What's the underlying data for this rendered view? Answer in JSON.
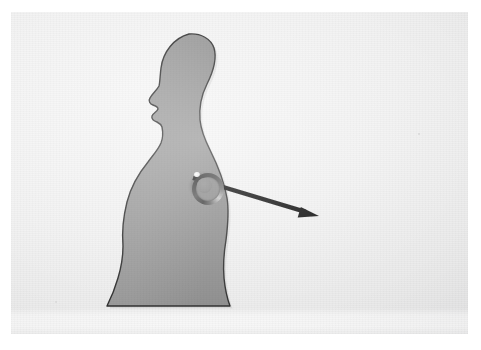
{
  "scene": {
    "kind": "photograph-of-printed-diagram",
    "description": "Photograph of a sheet of paper showing a gray human body silhouette in side profile facing left, with a small metal ring resting on the abdomen and a thick black arrow drawn from the ring toward the lower right.",
    "label": "body-silhouette-with-ring-and-arrow",
    "paper_color": "#f1f1f1",
    "page_margin_color": "#ffffff"
  },
  "silhouette": {
    "name": "human-body-profile",
    "orientation": "facing-left",
    "fill_color": "#979797",
    "outline_color": "#2e2e2e",
    "outline_width": 1.4,
    "parts": [
      "head",
      "nose",
      "lips",
      "chin",
      "neck",
      "chest",
      "abdomen",
      "hips",
      "legs"
    ],
    "path": "M 178 22 C 163 26 152 40 150 56 C 149 64 149 70 148 74 C 146 78 141 82 139 86 C 137 89 139 92 142 93 C 145 94 147 95 147 97 C 146 100 142 101 141 104 C 140 107 143 109 146 110 C 148 111 150 112 151 115 C 152 120 152 126 150 131 C 147 138 142 143 137 150 C 128 161 120 174 116 190 C 112 206 111 222 112 234 C 112 246 110 256 107 266 C 103 280 99 288 96 294 L 219 294 C 216 286 214 276 213 266 C 212 254 213 240 215 228 C 217 212 218 198 216 186 C 213 168 206 152 199 138 C 194 128 190 118 189 108 C 188 96 190 84 196 72 C 203 58 206 46 203 36 C 200 27 190 21 178 22 Z"
  },
  "ring_object": {
    "name": "metal-ring-marker",
    "center": [
      193,
      173
    ],
    "outer_diameter": 29,
    "inner_diameter": 15,
    "body_color": "#454545",
    "highlight_color": "#ffffff"
  },
  "arrow": {
    "name": "direction-arrow",
    "color": "#0d0d0d",
    "shaft_width": 4.4,
    "start": [
      182,
      166
    ],
    "end": [
      303,
      202
    ],
    "tip": [
      308,
      204
    ],
    "head_length": 20,
    "head_half_width": 7.5,
    "points_toward": "lower-right"
  }
}
